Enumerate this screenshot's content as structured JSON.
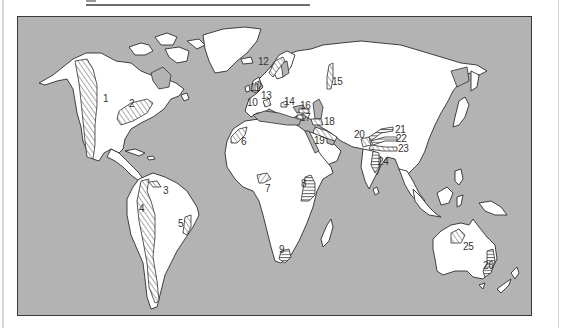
{
  "figure": {
    "type": "world-map",
    "colors": {
      "ocean": "#b3b3b3",
      "land": "#ffffff",
      "outline": "#2e2e2e",
      "hatch": "#555555",
      "frame": "#3a3a3a"
    }
  },
  "regions": [
    {
      "id": "1",
      "label": "1",
      "x": 102,
      "y": 93
    },
    {
      "id": "2",
      "label": "2",
      "x": 128,
      "y": 98
    },
    {
      "id": "3",
      "label": "3",
      "x": 162,
      "y": 185
    },
    {
      "id": "4",
      "label": "4",
      "x": 138,
      "y": 203
    },
    {
      "id": "5",
      "label": "5",
      "x": 177,
      "y": 218
    },
    {
      "id": "6",
      "label": "6",
      "x": 240,
      "y": 136
    },
    {
      "id": "7",
      "label": "7",
      "x": 264,
      "y": 183
    },
    {
      "id": "8",
      "label": "8",
      "x": 300,
      "y": 178
    },
    {
      "id": "9",
      "label": "9",
      "x": 278,
      "y": 244
    },
    {
      "id": "10",
      "label": "10",
      "x": 246,
      "y": 97
    },
    {
      "id": "11",
      "label": "11",
      "x": 249,
      "y": 82
    },
    {
      "id": "12",
      "label": "12",
      "x": 257,
      "y": 56
    },
    {
      "id": "13",
      "label": "13",
      "x": 260,
      "y": 90
    },
    {
      "id": "14",
      "label": "14",
      "x": 283,
      "y": 96
    },
    {
      "id": "15",
      "label": "15",
      "x": 331,
      "y": 76
    },
    {
      "id": "16",
      "label": "16",
      "x": 299,
      "y": 100
    },
    {
      "id": "17",
      "label": "17",
      "x": 299,
      "y": 112
    },
    {
      "id": "18",
      "label": "18",
      "x": 323,
      "y": 116
    },
    {
      "id": "19",
      "label": "19",
      "x": 313,
      "y": 135
    },
    {
      "id": "20",
      "label": "20",
      "x": 353,
      "y": 129
    },
    {
      "id": "21",
      "label": "21",
      "x": 394,
      "y": 124
    },
    {
      "id": "22",
      "label": "22",
      "x": 395,
      "y": 133
    },
    {
      "id": "23",
      "label": "23",
      "x": 397,
      "y": 143
    },
    {
      "id": "24",
      "label": "24",
      "x": 377,
      "y": 156
    },
    {
      "id": "25",
      "label": "25",
      "x": 462,
      "y": 241
    },
    {
      "id": "26",
      "label": "26",
      "x": 482,
      "y": 260
    }
  ]
}
